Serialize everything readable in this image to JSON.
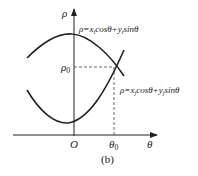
{
  "figure": {
    "caption": "(b)",
    "axes": {
      "y_label": "ρ",
      "x_label": "θ",
      "origin_label": "O",
      "rho0_label": "ρ",
      "rho0_sub": "0",
      "theta0_label": "θ",
      "theta0_sub": "0"
    },
    "curves": [
      {
        "name": "curve-i",
        "equation_parts": {
          "lhs": "ρ=x",
          "sub1": "i",
          "mid": "cosθ+y",
          "sub2": "i",
          "rhs": "sinθ"
        }
      },
      {
        "name": "curve-j",
        "equation_parts": {
          "lhs": "ρ=x",
          "sub1": "j",
          "mid": "cosθ+y",
          "sub2": "j",
          "rhs": "sinθ"
        }
      }
    ],
    "colors": {
      "line": "#222222",
      "dash": "#444444"
    }
  }
}
